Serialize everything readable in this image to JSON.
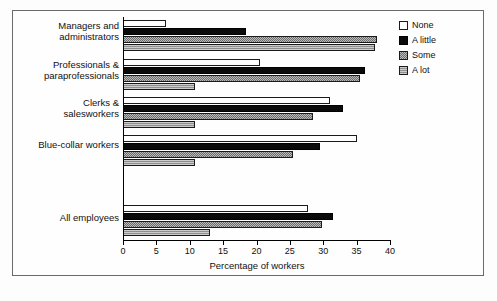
{
  "chart_data": {
    "type": "bar",
    "orientation": "horizontal",
    "title": "",
    "xlabel": "Percentage of workers",
    "ylabel": "",
    "xlim": [
      0,
      40
    ],
    "xticks": [
      0,
      5,
      10,
      15,
      20,
      25,
      30,
      35,
      40
    ],
    "grid": false,
    "legend_position": "right",
    "categories": [
      "Managers and administrators",
      "Professionals & paraprofessionals",
      "Clerks & salesworkers",
      "Blue-collar workers",
      "All employees"
    ],
    "series": [
      {
        "name": "None",
        "values": [
          6.4,
          20.5,
          31.0,
          35.0,
          27.7
        ]
      },
      {
        "name": "A little",
        "values": [
          18.5,
          36.2,
          33.0,
          29.5,
          31.5
        ]
      },
      {
        "name": "Some",
        "values": [
          38.0,
          35.5,
          28.5,
          25.5,
          29.8
        ]
      },
      {
        "name": "A lot",
        "values": [
          37.8,
          10.8,
          10.8,
          10.8,
          13.0
        ]
      }
    ]
  },
  "legend": {
    "items": [
      {
        "label": "None",
        "swatch": "white-square-icon"
      },
      {
        "label": "A little",
        "swatch": "black-square-icon"
      },
      {
        "label": "Some",
        "swatch": "checkered-square-icon"
      },
      {
        "label": "A lot",
        "swatch": "gray-hatched-square-icon"
      }
    ]
  },
  "axis": {
    "x_title": "Percentage of workers",
    "x_tick_labels": [
      "0",
      "5",
      "10",
      "15",
      "20",
      "25",
      "30",
      "35",
      "40"
    ]
  },
  "category_labels": [
    {
      "line1": "Managers and",
      "line2": "administrators"
    },
    {
      "line1": "Professionals &",
      "line2": "paraprofessionals"
    },
    {
      "line1": "Clerks &",
      "line2": "salesworkers"
    },
    {
      "line1": "Blue-collar workers",
      "line2": ""
    },
    {
      "line1": "All employees",
      "line2": ""
    }
  ]
}
